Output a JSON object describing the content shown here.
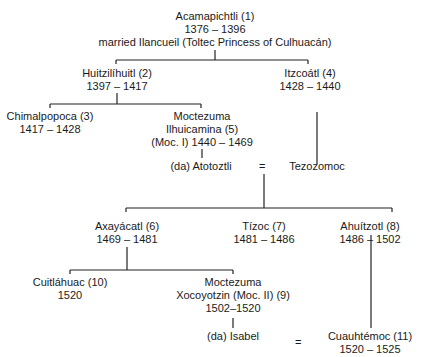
{
  "diagram": {
    "type": "genealogy",
    "nodes": {
      "acamapichtli": {
        "name": "Acamapichtli (1)",
        "years": "1376 – 1396",
        "note": "married Ilancueil (Toltec Princess of Culhuacán)"
      },
      "huitzilihuitl": {
        "name": "Huitzilíhuitl (2)",
        "years": "1397 – 1417"
      },
      "itzcoatl": {
        "name": "Itzcoátl (4)",
        "years": "1428 – 1440"
      },
      "chimalpopoca": {
        "name": "Chimalpopoca (3)",
        "years": "1417 – 1428"
      },
      "moctezuma1": {
        "line1": "Moctezuma",
        "line2": "Ilhuicamina (5)",
        "line3": "(Moc. I) 1440 – 1469"
      },
      "atotoztli": {
        "name": "(da) Atotoztli"
      },
      "tezozomoc": {
        "name": "Tezozomoc"
      },
      "axayacatl": {
        "name": "Axayácatl (6)",
        "years": "1469 – 1481"
      },
      "tizoc": {
        "name": "Tízoc (7)",
        "years": "1481 – 1486"
      },
      "ahuitzotl": {
        "name": "Ahuítzotl (8)",
        "years": "1486 – 1502"
      },
      "cuitlahuac": {
        "name": "Cuitláhuac (10)",
        "years": "1520"
      },
      "moctezuma2": {
        "line1": "Moctezuma",
        "line2": "Xocoyotzin (Moc. II) (9)",
        "line3": "1502–1520"
      },
      "isabel": {
        "name": "(da) Isabel"
      },
      "cuauhtemoc": {
        "name": "Cuauhtémoc (11)",
        "years": "1520 – 1525"
      }
    },
    "marriage_symbol": "=",
    "edges": [
      [
        "acamapichtli",
        "huitzilihuitl"
      ],
      [
        "acamapichtli",
        "itzcoatl"
      ],
      [
        "huitzilihuitl",
        "chimalpopoca"
      ],
      [
        "huitzilihuitl",
        "moctezuma1"
      ],
      [
        "moctezuma1",
        "atotoztli"
      ],
      [
        "itzcoatl",
        "tezozomoc"
      ],
      [
        "atotoztli=tezozomoc",
        "axayacatl"
      ],
      [
        "atotoztli=tezozomoc",
        "tizoc"
      ],
      [
        "atotoztli=tezozomoc",
        "ahuitzotl"
      ],
      [
        "axayacatl",
        "cuitlahuac"
      ],
      [
        "axayacatl",
        "moctezuma2"
      ],
      [
        "moctezuma2",
        "isabel"
      ],
      [
        "ahuitzotl",
        "cuauhtemoc"
      ]
    ],
    "marriages": [
      [
        "atotoztli",
        "tezozomoc"
      ],
      [
        "isabel",
        "cuauhtemoc"
      ]
    ]
  }
}
